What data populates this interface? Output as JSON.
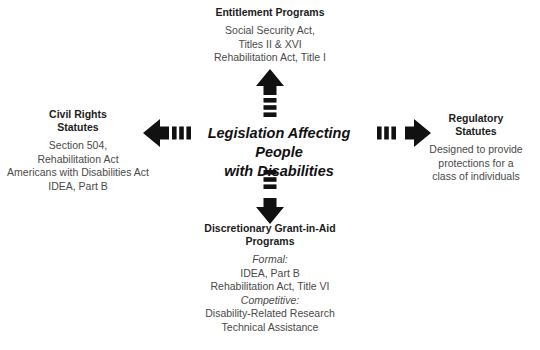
{
  "diagram": {
    "center": {
      "label": "Legislation Affecting People\nwith Disabilities"
    },
    "branches": {
      "top": {
        "heading": "Entitlement Programs",
        "lines": [
          {
            "text": "Social Security Act,",
            "italic": false
          },
          {
            "text": "Titles II & XVI",
            "italic": false
          },
          {
            "text": "Rehabilitation Act, Title I",
            "italic": false
          }
        ]
      },
      "left": {
        "heading": "Civil Rights\nStatutes",
        "lines": [
          {
            "text": "Section 504,",
            "italic": false
          },
          {
            "text": "Rehabilitation Act",
            "italic": false
          },
          {
            "text": "Americans with Disabilities Act",
            "italic": false
          },
          {
            "text": "IDEA, Part B",
            "italic": false
          }
        ]
      },
      "right": {
        "heading": "Regulatory\nStatutes",
        "lines": [
          {
            "text": "Designed to provide",
            "italic": false
          },
          {
            "text": "protections for a",
            "italic": false
          },
          {
            "text": "class of individuals",
            "italic": false
          }
        ]
      },
      "bottom": {
        "heading": "Discretionary Grant-in-Aid\nPrograms",
        "lines": [
          {
            "text": "Formal:",
            "italic": true
          },
          {
            "text": "IDEA, Part B",
            "italic": false
          },
          {
            "text": "Rehabilitation Act, Title VI",
            "italic": false
          },
          {
            "text": "Competitive:",
            "italic": true
          },
          {
            "text": "Disability-Related Research",
            "italic": false
          },
          {
            "text": "Technical Assistance",
            "italic": false
          }
        ]
      }
    },
    "arrows": {
      "up": "arrow-up-icon",
      "down": "arrow-down-icon",
      "left": "arrow-left-icon",
      "right": "arrow-right-icon",
      "color": "#111111",
      "tail_segments": 3
    },
    "colors": {
      "background": "#ffffff",
      "heading_text": "#1c1c1c",
      "body_text": "#4a4a4a",
      "center_text": "#111111",
      "arrow_fill": "#111111"
    }
  }
}
